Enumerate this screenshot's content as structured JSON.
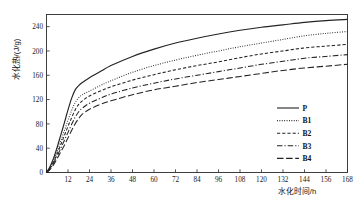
{
  "chart_data": {
    "type": "line",
    "title": "",
    "xlabel": "水化时间/h",
    "ylabel": "水化热/(J/g)",
    "xlim": [
      0,
      168
    ],
    "ylim": [
      0,
      260
    ],
    "grid": false,
    "legend_position": "bottom-right",
    "xticks": [
      0,
      12,
      24,
      36,
      48,
      60,
      72,
      84,
      96,
      108,
      120,
      132,
      144,
      156,
      168
    ],
    "yticks": [
      0,
      40,
      80,
      120,
      160,
      200,
      240
    ],
    "x": [
      0,
      2,
      4,
      6,
      8,
      10,
      12,
      14,
      16,
      18,
      20,
      24,
      30,
      36,
      48,
      60,
      72,
      84,
      96,
      108,
      120,
      132,
      144,
      156,
      168
    ],
    "series": [
      {
        "name": "P",
        "style": "solid",
        "color": "#232323",
        "values": [
          0,
          10,
          24,
          42,
          62,
          82,
          103,
          122,
          136,
          143,
          148,
          156,
          166,
          176,
          191,
          203,
          213,
          221,
          228,
          234,
          239,
          243,
          247,
          250,
          252
        ]
      },
      {
        "name": "B1",
        "style": "dotted",
        "color": "#232323",
        "values": [
          0,
          8,
          20,
          35,
          52,
          69,
          86,
          102,
          115,
          123,
          128,
          134,
          143,
          151,
          165,
          176,
          185,
          193,
          200,
          207,
          213,
          219,
          225,
          229,
          232
        ]
      },
      {
        "name": "B2",
        "style": "dashed",
        "color": "#232323",
        "values": [
          0,
          7,
          18,
          31,
          46,
          61,
          76,
          90,
          103,
          112,
          118,
          126,
          134,
          141,
          152,
          161,
          169,
          176,
          182,
          189,
          195,
          200,
          205,
          208,
          211
        ]
      },
      {
        "name": "B3",
        "style": "dashdot",
        "color": "#232323",
        "values": [
          0,
          6,
          16,
          27,
          40,
          53,
          66,
          79,
          91,
          100,
          106,
          114,
          122,
          129,
          139,
          147,
          154,
          160,
          166,
          172,
          178,
          183,
          188,
          191,
          194
        ]
      },
      {
        "name": "B4",
        "style": "longdash",
        "color": "#232323",
        "values": [
          0,
          5,
          13,
          23,
          34,
          45,
          57,
          69,
          80,
          89,
          96,
          104,
          112,
          118,
          128,
          136,
          142,
          148,
          153,
          158,
          163,
          168,
          172,
          175,
          178
        ]
      }
    ]
  },
  "legend": {
    "items": [
      {
        "label": "P"
      },
      {
        "label": "B1"
      },
      {
        "label": "B2"
      },
      {
        "label": "B3"
      },
      {
        "label": "B4"
      }
    ]
  }
}
